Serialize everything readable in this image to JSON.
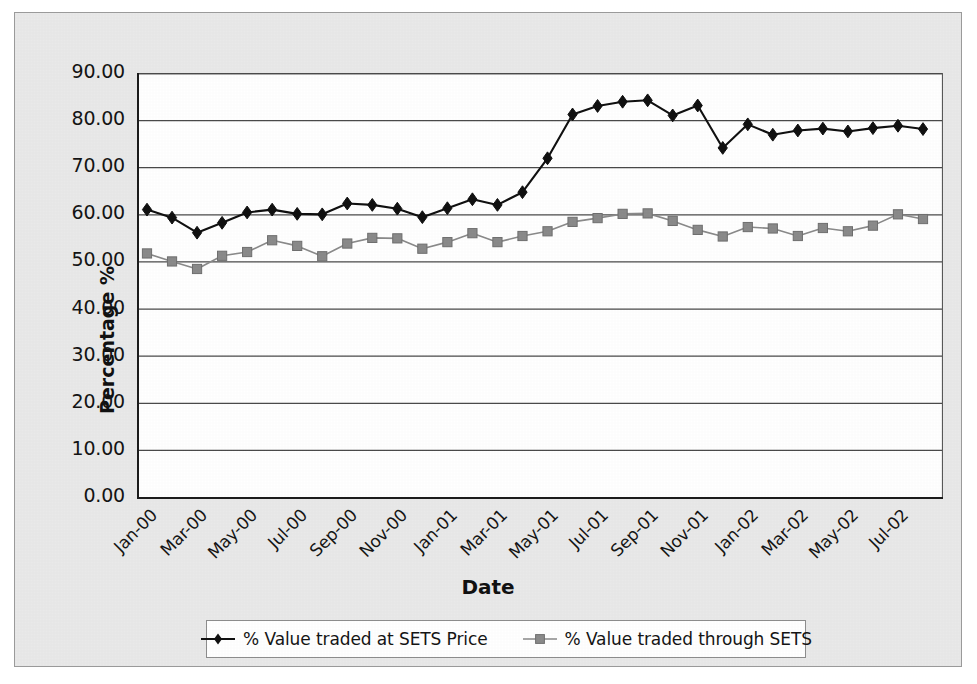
{
  "chart_data": {
    "type": "line",
    "title": "",
    "xlabel": "Date",
    "ylabel": "Percentage %",
    "ylim": [
      0,
      90
    ],
    "ytick_labels": [
      "0.00",
      "10.00",
      "20.00",
      "30.00",
      "40.00",
      "50.00",
      "60.00",
      "70.00",
      "80.00",
      "90.00"
    ],
    "ytick_values": [
      0,
      10,
      20,
      30,
      40,
      50,
      60,
      70,
      80,
      90
    ],
    "grid": true,
    "grid_axis": "y",
    "legend_position": "bottom",
    "x": [
      "Jan-00",
      "Feb-00",
      "Mar-00",
      "Apr-00",
      "May-00",
      "Jun-00",
      "Jul-00",
      "Aug-00",
      "Sep-00",
      "Oct-00",
      "Nov-00",
      "Dec-00",
      "Jan-01",
      "Feb-01",
      "Mar-01",
      "Apr-01",
      "May-01",
      "Jun-01",
      "Jul-01",
      "Aug-01",
      "Sep-01",
      "Oct-01",
      "Nov-01",
      "Dec-01",
      "Jan-02",
      "Feb-02",
      "Mar-02",
      "Apr-02",
      "May-02",
      "Jun-02",
      "Jul-02",
      "Aug-02"
    ],
    "xtick_labels": [
      "Jan-00",
      "Mar-00",
      "May-00",
      "Jul-00",
      "Sep-00",
      "Nov-00",
      "Jan-01",
      "Mar-01",
      "May-01",
      "Jul-01",
      "Sep-01",
      "Nov-01",
      "Jan-02",
      "Mar-02",
      "May-02",
      "Jul-02"
    ],
    "xtick_indices": [
      0,
      2,
      4,
      6,
      8,
      10,
      12,
      14,
      16,
      18,
      20,
      22,
      24,
      26,
      28,
      30
    ],
    "series": [
      {
        "name": "% Value traded at SETS Price",
        "color": "#101010",
        "marker": "diamond",
        "values": [
          61.0,
          59.3,
          56.1,
          58.2,
          60.4,
          61.0,
          60.1,
          60.0,
          62.3,
          62.0,
          61.2,
          59.4,
          61.3,
          63.2,
          62.0,
          64.7,
          71.9,
          81.2,
          83.0,
          83.9,
          84.2,
          81.0,
          83.1,
          74.1,
          79.1,
          76.9,
          77.8,
          78.2,
          77.6,
          78.3,
          78.8,
          78.1
        ]
      },
      {
        "name": "% Value traded through SETS",
        "color": "#8a8a8a",
        "marker": "square",
        "values": [
          51.7,
          50.0,
          48.4,
          51.2,
          52.0,
          54.5,
          53.3,
          51.1,
          53.8,
          55.0,
          54.9,
          52.7,
          54.1,
          56.0,
          54.1,
          55.4,
          56.4,
          58.4,
          59.2,
          60.1,
          60.2,
          58.6,
          56.7,
          55.3,
          57.3,
          57.0,
          55.4,
          57.1,
          56.4,
          57.6,
          60.0,
          59.0
        ]
      }
    ]
  },
  "legend": {
    "entries": [
      {
        "label": "% Value traded at SETS Price",
        "marker": "diamond-marker-icon"
      },
      {
        "label": "% Value traded through SETS",
        "marker": "square-marker-icon"
      }
    ]
  },
  "axes": {
    "x_title": "Date",
    "y_title": "Percentage %"
  }
}
